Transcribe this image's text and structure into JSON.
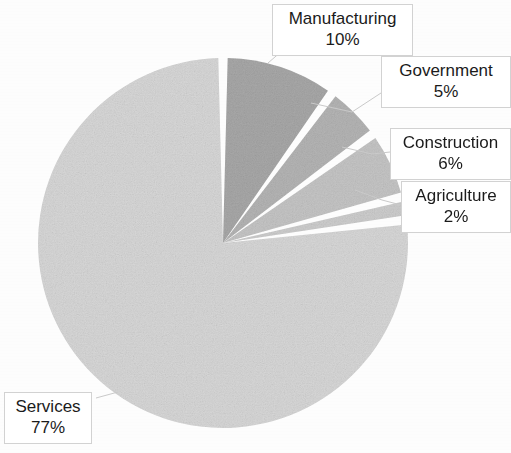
{
  "chart_data": {
    "type": "pie",
    "title": "",
    "categories": [
      "Manufacturing",
      "Government",
      "Construction",
      "Agriculture",
      "Services"
    ],
    "values": [
      10,
      5,
      6,
      2,
      77
    ],
    "value_unit": "%",
    "labels": [
      "Manufacturing 10%",
      "Government 5%",
      "Construction 6%",
      "Agriculture 2%",
      "Services 77%"
    ],
    "colors": [
      "#a9a9a9",
      "#b6b6b6",
      "#c7c7c7",
      "#cfcfcf",
      "#d9d9d9"
    ],
    "legend": "none",
    "grid": false,
    "data_labels": "outside-boxed-callouts",
    "slice_separator_color": "#ffffff",
    "start_angle_deg": 0,
    "direction": "clockwise"
  },
  "chart": {
    "geometry": {
      "center_x": 223,
      "center_y": 243,
      "radius": 185
    },
    "slices": [
      {
        "name": "Manufacturing",
        "percent_label": "10%",
        "value": 10,
        "color": "#a9a9a9",
        "callout_label": "Manufacturing",
        "callout_value": "10%"
      },
      {
        "name": "Government",
        "percent_label": "5%",
        "value": 5,
        "color": "#b6b6b6",
        "callout_label": "Government",
        "callout_value": "5%"
      },
      {
        "name": "Construction",
        "percent_label": "6%",
        "value": 6,
        "color": "#c7c7c7",
        "callout_label": "Construction",
        "callout_value": "6%"
      },
      {
        "name": "Agriculture",
        "percent_label": "2%",
        "value": 2,
        "color": "#cfcfcf",
        "callout_label": "Agriculture",
        "callout_value": "2%"
      },
      {
        "name": "Services",
        "percent_label": "77%",
        "value": 77,
        "color": "#d9d9d9",
        "callout_label": "Services",
        "callout_value": "77%"
      }
    ]
  }
}
